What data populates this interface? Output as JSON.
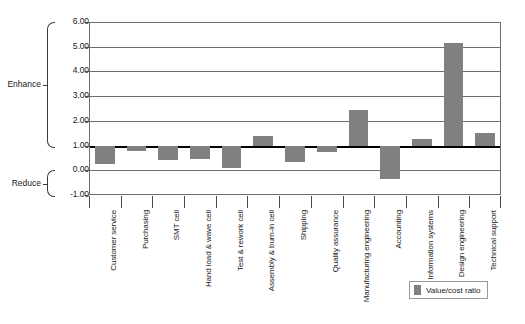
{
  "chart_data": {
    "type": "bar",
    "title": "",
    "xlabel": "",
    "ylabel": "",
    "ylim": [
      -1.0,
      6.0
    ],
    "grid": true,
    "legend_position": "bottom-right",
    "reference_line": 1.0,
    "categories": [
      "Customer service",
      "Purchasing",
      "SMT cell",
      "Hand load & wave cell",
      "Test & rework cell",
      "Assembly & burn-in cell",
      "Shipping",
      "Quality assurance",
      "Manufacturing engineering",
      "Accounting",
      "Information systems",
      "Design engineering",
      "Technical support"
    ],
    "series": [
      {
        "name": "Value/cost ratio",
        "color": "#808080",
        "values": [
          0.25,
          0.8,
          0.42,
          0.45,
          0.1,
          1.4,
          0.35,
          0.75,
          2.45,
          -0.35,
          1.25,
          5.15,
          1.5
        ]
      }
    ],
    "ytick_labels": [
      "6.00",
      "5.00",
      "4.00",
      "3.00",
      "2.00",
      "1.00",
      "0.00",
      "-1.00"
    ],
    "ytick_values": [
      6.0,
      5.0,
      4.0,
      3.0,
      2.0,
      1.0,
      0.0,
      -1.0
    ],
    "annotations": [
      {
        "label": "Enhance",
        "from": 1.0,
        "to": 6.0
      },
      {
        "label": "Reduce",
        "from": -1.0,
        "to": 0.0
      }
    ]
  },
  "legend": {
    "entries": [
      {
        "label": "Value/cost ratio",
        "color": "#808080"
      }
    ]
  },
  "caption": {
    "text": ""
  }
}
